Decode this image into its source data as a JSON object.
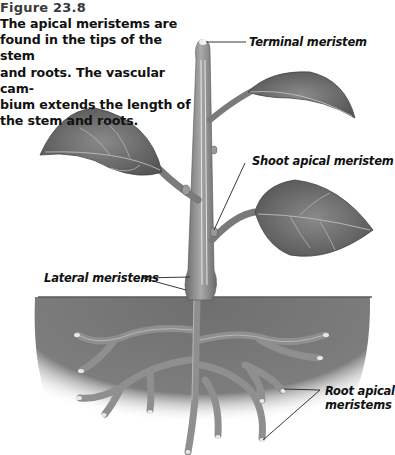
{
  "figure": {
    "number": "Figure 23.8",
    "caption_lines": [
      "The apical meristems are",
      "found in the tips of the stem",
      "and roots. The vascular cam-",
      "bium extends the length of",
      "the stem and roots."
    ]
  },
  "labels": {
    "terminal_meristem": "Terminal meristem",
    "shoot_apical_meristem": "Shoot apical meristem",
    "lateral_meristems": "Lateral meristems",
    "root_apical_line1": "Root apical",
    "root_apical_line2": "meristems"
  },
  "colors": {
    "soil": "#7a7a7a",
    "stem": "#8c8c8c",
    "leaf": "#6e6e6e",
    "vascular": "#d8d8d8",
    "text": "#111111"
  }
}
